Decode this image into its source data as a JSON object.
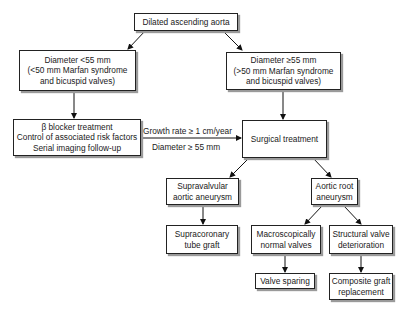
{
  "flowchart": {
    "nodes": {
      "root": {
        "lines": [
          "Dilated ascending aorta"
        ]
      },
      "small": {
        "lines": [
          "Diameter <55 mm",
          "(<50 mm Marfan syndrome",
          "and bicuspid valves)"
        ]
      },
      "large": {
        "lines": [
          "Diameter ≥55 mm",
          "(>50 mm Marfan syndrome",
          "and bicuspid valves)"
        ]
      },
      "medical": {
        "lines": [
          "β blocker treatment",
          "Control of associated risk factors",
          "Serial imaging follow-up"
        ]
      },
      "surgical": {
        "lines": [
          "Surgical treatment"
        ]
      },
      "supravalvular": {
        "lines": [
          "Supravalvular",
          "aortic aneurysm"
        ]
      },
      "aortic_root": {
        "lines": [
          "Aortic root",
          "aneurysm"
        ]
      },
      "supracoronary": {
        "lines": [
          "Supracoronary",
          "tube graft"
        ]
      },
      "normal_valves": {
        "lines": [
          "Macroscopically",
          "normal valves"
        ]
      },
      "deterioration": {
        "lines": [
          "Structural valve",
          "deterioration"
        ]
      },
      "valve_sparing": {
        "lines": [
          "Valve sparing"
        ]
      },
      "composite": {
        "lines": [
          "Composite graft",
          "replacement"
        ]
      }
    },
    "edge_labels": {
      "growth": "Growth rate ≥ 1 cm/year",
      "diameter": "Diameter ≥ 55 mm"
    },
    "edges": [
      [
        "root",
        "small"
      ],
      [
        "root",
        "large"
      ],
      [
        "small",
        "medical"
      ],
      [
        "large",
        "surgical"
      ],
      [
        "medical",
        "surgical"
      ],
      [
        "surgical",
        "supravalvular"
      ],
      [
        "surgical",
        "aortic_root"
      ],
      [
        "supravalvular",
        "supracoronary"
      ],
      [
        "aortic_root",
        "normal_valves"
      ],
      [
        "aortic_root",
        "deterioration"
      ],
      [
        "normal_valves",
        "valve_sparing"
      ],
      [
        "deterioration",
        "composite"
      ]
    ]
  }
}
